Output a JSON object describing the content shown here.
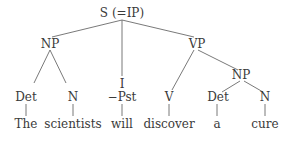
{
  "diagram": {
    "type": "syntax-tree",
    "nodes": {
      "root": "S (=IP)",
      "np_subject": "NP",
      "infl_label": "I",
      "infl_value": "−Pst",
      "vp": "VP",
      "np_object": "NP",
      "det_subject": "Det",
      "n_subject": "N",
      "verb": "V",
      "det_object": "Det",
      "n_object": "N"
    },
    "words": {
      "w1": "The",
      "w2": "scientists",
      "w3": "will",
      "w4": "discover",
      "w5": "a",
      "w6": "cure"
    },
    "colors": {
      "text": "#3a3a3a",
      "lines": "#6a6a6a",
      "background": "#ffffff"
    }
  }
}
